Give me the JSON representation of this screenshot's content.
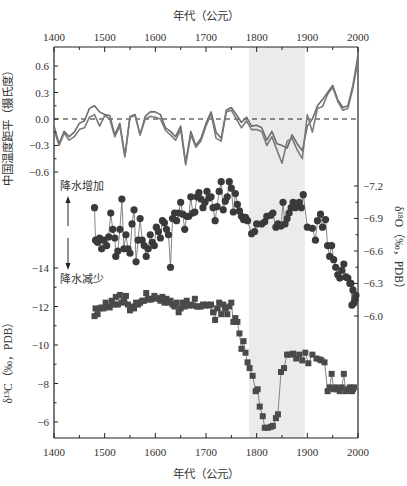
{
  "chart_data": {
    "type": "line",
    "title": "",
    "x_axis": {
      "label_top": "年代（公元）",
      "label_bottom": "年代（公元）",
      "range": [
        1400,
        2000
      ],
      "ticks": [
        1400,
        1500,
        1600,
        1700,
        1800,
        1900,
        2000
      ],
      "minor_step": 50
    },
    "shaded_region": {
      "x_start": 1785,
      "x_end": 1895,
      "color": "#ebebeb"
    },
    "axes": {
      "left_top": {
        "label": "中国温度距平（摄氏度）",
        "ticks": [
          0.6,
          0.3,
          0.0,
          -0.3,
          -0.6
        ],
        "tick_labels": [
          "0.6",
          "0.3",
          "0.0",
          "-0.3",
          "-0.6"
        ]
      },
      "right": {
        "label": "δ¹⁸O（‰，PDB）",
        "ticks": [
          -7.2,
          -6.9,
          -6.6,
          -6.3,
          -6.0
        ],
        "tick_labels": [
          "-7.2",
          "-6.9",
          "-6.6",
          "-6.3",
          "-6.0"
        ],
        "inverted": true
      },
      "left_bottom": {
        "label": "δ¹³C（‰，PDB）",
        "ticks": [
          -14,
          -12,
          -10,
          -8,
          -6
        ],
        "tick_labels": [
          "-14",
          "-12",
          "-10",
          "-8",
          "-6"
        ],
        "inverted": true
      }
    },
    "annotations": {
      "precip_increase": "降水增加",
      "precip_decrease": "降水减少"
    },
    "series": [
      {
        "name": "中国温度距平 (序列1)",
        "axis": "left_top",
        "marker": "none",
        "color": "#6b6b6b",
        "x": [
          1400,
          1410,
          1420,
          1430,
          1440,
          1450,
          1460,
          1470,
          1480,
          1490,
          1500,
          1510,
          1520,
          1530,
          1540,
          1550,
          1560,
          1570,
          1580,
          1590,
          1600,
          1610,
          1620,
          1630,
          1640,
          1650,
          1660,
          1670,
          1680,
          1690,
          1700,
          1710,
          1720,
          1730,
          1740,
          1750,
          1760,
          1770,
          1780,
          1790,
          1800,
          1810,
          1820,
          1830,
          1840,
          1850,
          1860,
          1870,
          1880,
          1890,
          1900,
          1910,
          1920,
          1930,
          1940,
          1950,
          1960,
          1970,
          1980,
          1990,
          2000
        ],
        "values": [
          -0.08,
          -0.28,
          -0.14,
          -0.2,
          -0.15,
          -0.05,
          -0.02,
          0.12,
          0.15,
          0.08,
          0.05,
          0.04,
          -0.18,
          -0.05,
          -0.42,
          0.03,
          0.05,
          -0.18,
          0.03,
          0.08,
          0.08,
          0.05,
          -0.1,
          -0.14,
          -0.2,
          -0.08,
          -0.5,
          -0.14,
          -0.3,
          -0.22,
          -0.05,
          0.08,
          -0.15,
          -0.22,
          0.1,
          0.13,
          0.05,
          -0.04,
          0.02,
          -0.08,
          -0.07,
          -0.1,
          -0.24,
          -0.14,
          -0.28,
          -0.3,
          -0.33,
          -0.18,
          -0.28,
          -0.36,
          -0.08,
          0.0,
          0.15,
          0.22,
          0.3,
          0.38,
          0.22,
          0.13,
          0.15,
          0.38,
          0.72
        ]
      },
      {
        "name": "中国温度距平 (序列2)",
        "axis": "left_top",
        "marker": "none",
        "color": "#7a7a7a",
        "x": [
          1400,
          1410,
          1420,
          1430,
          1440,
          1450,
          1460,
          1470,
          1480,
          1490,
          1500,
          1510,
          1520,
          1530,
          1540,
          1550,
          1560,
          1570,
          1580,
          1590,
          1600,
          1610,
          1620,
          1630,
          1640,
          1650,
          1660,
          1670,
          1680,
          1690,
          1700,
          1710,
          1720,
          1730,
          1740,
          1750,
          1760,
          1770,
          1780,
          1790,
          1800,
          1810,
          1820,
          1830,
          1840,
          1850,
          1860,
          1870,
          1880,
          1890,
          1900,
          1910,
          1920,
          1930,
          1940,
          1950,
          1960,
          1970,
          1980,
          1990,
          2000
        ],
        "values": [
          -0.12,
          -0.3,
          -0.16,
          -0.24,
          -0.2,
          -0.12,
          -0.1,
          0.02,
          0.05,
          -0.08,
          0.04,
          0.0,
          -0.2,
          -0.08,
          -0.43,
          0.02,
          0.04,
          -0.18,
          0.0,
          0.03,
          0.02,
          0.0,
          -0.13,
          -0.18,
          -0.24,
          -0.12,
          -0.52,
          -0.18,
          -0.32,
          -0.25,
          -0.08,
          0.06,
          -0.22,
          -0.25,
          0.08,
          0.1,
          0.0,
          -0.1,
          -0.02,
          -0.12,
          -0.12,
          -0.14,
          -0.3,
          -0.2,
          -0.35,
          -0.5,
          -0.25,
          -0.22,
          -0.35,
          -0.45,
          0.05,
          -0.15,
          0.12,
          0.14,
          0.28,
          0.36,
          0.2,
          0.1,
          0.12,
          0.35,
          0.66
        ]
      },
      {
        "name": "δ¹⁸O",
        "axis": "right",
        "marker": "circle",
        "color": "#3a3a3a",
        "x": [
          1480,
          1482,
          1486,
          1490,
          1494,
          1498,
          1504,
          1508,
          1512,
          1516,
          1520,
          1522,
          1526,
          1530,
          1534,
          1538,
          1542,
          1546,
          1550,
          1554,
          1558,
          1562,
          1566,
          1570,
          1574,
          1578,
          1582,
          1586,
          1590,
          1594,
          1598,
          1602,
          1606,
          1610,
          1614,
          1618,
          1622,
          1626,
          1630,
          1634,
          1638,
          1642,
          1646,
          1650,
          1654,
          1658,
          1662,
          1666,
          1670,
          1674,
          1678,
          1682,
          1686,
          1690,
          1694,
          1698,
          1702,
          1706,
          1710,
          1714,
          1718,
          1722,
          1726,
          1730,
          1734,
          1738,
          1742,
          1746,
          1750,
          1754,
          1758,
          1762,
          1766,
          1770,
          1774,
          1778,
          1782,
          1790,
          1796,
          1800,
          1810,
          1816,
          1820,
          1828,
          1832,
          1838,
          1842,
          1848,
          1852,
          1856,
          1860,
          1864,
          1868,
          1872,
          1876,
          1880,
          1884,
          1888,
          1892,
          1900,
          1910,
          1916,
          1920,
          1926,
          1930,
          1936,
          1940,
          1944,
          1948,
          1952,
          1956,
          1960,
          1964,
          1968,
          1972,
          1976,
          1980,
          1984,
          1986,
          1988,
          1990,
          1992,
          1994,
          1996
        ],
        "values": [
          -7.0,
          -6.7,
          -6.68,
          -6.72,
          -6.62,
          -6.7,
          -6.65,
          -6.73,
          -6.95,
          -6.8,
          -6.72,
          -6.55,
          -6.6,
          -6.8,
          -7.08,
          -6.62,
          -6.75,
          -6.62,
          -6.58,
          -6.85,
          -6.98,
          -6.5,
          -6.7,
          -6.9,
          -6.7,
          -6.65,
          -6.55,
          -6.62,
          -6.75,
          -6.68,
          -6.65,
          -6.82,
          -6.78,
          -6.72,
          -6.88,
          -6.86,
          -6.8,
          -6.75,
          -6.45,
          -6.9,
          -6.95,
          -6.88,
          -6.95,
          -7.05,
          -6.94,
          -6.8,
          -6.92,
          -6.92,
          -7.1,
          -6.95,
          -6.96,
          -7.1,
          -7.14,
          -7.08,
          -7.0,
          -7.05,
          -7.15,
          -7.09,
          -7.1,
          -7.0,
          -6.88,
          -7.01,
          -7.15,
          -7.24,
          -6.98,
          -7.06,
          -7.1,
          -7.24,
          -7.18,
          -6.96,
          -7.13,
          -7.03,
          -6.97,
          -6.92,
          -6.89,
          -6.91,
          -6.88,
          -6.76,
          -6.78,
          -6.85,
          -6.85,
          -6.87,
          -6.92,
          -6.93,
          -6.95,
          -6.82,
          -6.85,
          -6.83,
          -7.05,
          -6.85,
          -6.9,
          -6.95,
          -7.0,
          -7.05,
          -7.0,
          -7.03,
          -7.05,
          -7.0,
          -7.12,
          -6.82,
          -6.81,
          -6.7,
          -6.88,
          -6.94,
          -6.82,
          -6.89,
          -6.65,
          -6.55,
          -6.65,
          -6.52,
          -6.45,
          -6.38,
          -6.35,
          -6.42,
          -6.48,
          -6.36,
          -6.35,
          -6.3,
          -6.3,
          -6.1,
          -6.24,
          -6.12,
          -6.15,
          -6.19
        ]
      },
      {
        "name": "δ¹³C",
        "axis": "left_bottom",
        "marker": "square",
        "color": "#4a4a4a",
        "x": [
          1480,
          1482,
          1486,
          1490,
          1494,
          1498,
          1502,
          1506,
          1510,
          1514,
          1518,
          1522,
          1526,
          1530,
          1534,
          1538,
          1542,
          1546,
          1550,
          1554,
          1558,
          1562,
          1566,
          1570,
          1574,
          1578,
          1582,
          1586,
          1590,
          1594,
          1598,
          1602,
          1606,
          1610,
          1614,
          1618,
          1622,
          1626,
          1630,
          1634,
          1638,
          1642,
          1646,
          1650,
          1654,
          1658,
          1662,
          1666,
          1670,
          1674,
          1678,
          1682,
          1686,
          1690,
          1694,
          1698,
          1702,
          1706,
          1710,
          1714,
          1718,
          1722,
          1726,
          1730,
          1734,
          1738,
          1742,
          1746,
          1750,
          1754,
          1758,
          1762,
          1766,
          1770,
          1774,
          1778,
          1782,
          1786,
          1792,
          1798,
          1802,
          1806,
          1812,
          1816,
          1822,
          1828,
          1832,
          1838,
          1842,
          1848,
          1854,
          1860,
          1866,
          1872,
          1878,
          1884,
          1890,
          1896,
          1902,
          1910,
          1918,
          1924,
          1928,
          1934,
          1940,
          1944,
          1948,
          1952,
          1956,
          1960,
          1964,
          1968,
          1972,
          1976,
          1980,
          1984,
          1986,
          1988,
          1990,
          1992
        ],
        "values": [
          -11.5,
          -11.9,
          -11.6,
          -11.9,
          -11.95,
          -11.9,
          -12.2,
          -12.0,
          -11.95,
          -12.3,
          -12.1,
          -12.5,
          -12.1,
          -12.6,
          -12.2,
          -12.3,
          -12.55,
          -12.1,
          -11.8,
          -12.0,
          -11.9,
          -12.2,
          -12.1,
          -12.2,
          -12.3,
          -12.3,
          -12.7,
          -12.4,
          -12.35,
          -12.4,
          -12.55,
          -12.45,
          -12.4,
          -12.3,
          -12.5,
          -12.2,
          -12.4,
          -12.2,
          -12.3,
          -12.1,
          -12.0,
          -12.2,
          -11.7,
          -11.9,
          -12.2,
          -12.0,
          -12.3,
          -12.05,
          -12.1,
          -12.05,
          -12.4,
          -12.0,
          -12.0,
          -12.0,
          -12.1,
          -12.05,
          -12.1,
          -12.05,
          -12.1,
          -11.7,
          -11.3,
          -11.9,
          -12.2,
          -11.6,
          -12.1,
          -11.9,
          -11.6,
          -12.0,
          -12.2,
          -11.2,
          -11.4,
          -11.2,
          -10.6,
          -9.8,
          -10.2,
          -9.6,
          -9.1,
          -8.8,
          -8.4,
          -7.6,
          -7.7,
          -6.8,
          -6.3,
          -5.7,
          -5.7,
          -5.75,
          -5.8,
          -6.2,
          -6.4,
          -8.6,
          -8.8,
          -9.5,
          -9.5,
          -9.55,
          -9.3,
          -9.5,
          -9.2,
          -9.6,
          -9.05,
          -9.5,
          -9.3,
          -9.25,
          -9.2,
          -9.1,
          -7.6,
          -7.8,
          -8.5,
          -7.7,
          -7.8,
          -7.7,
          -7.6,
          -7.8,
          -8.5,
          -7.6,
          -7.7,
          -7.8,
          -7.7,
          -7.6,
          -7.7,
          -7.8
        ]
      }
    ]
  }
}
